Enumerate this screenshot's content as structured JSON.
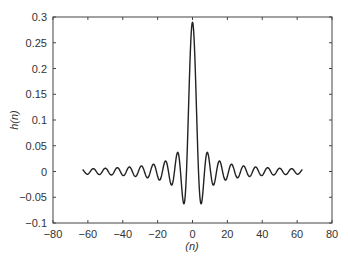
{
  "chart_data": {
    "type": "line",
    "title": "",
    "xlabel": "(n)",
    "ylabel": "h(n)",
    "xlim": [
      -80,
      80
    ],
    "ylim": [
      -0.1,
      0.3
    ],
    "xticks": [
      -80,
      -60,
      -40,
      -20,
      0,
      20,
      40,
      60,
      80
    ],
    "xtick_labels": [
      "−80",
      "−60",
      "−40",
      "−20",
      "0",
      "20",
      "40",
      "60",
      "80"
    ],
    "yticks": [
      -0.1,
      -0.05,
      0,
      0.05,
      0.1,
      0.15,
      0.2,
      0.25,
      0.3
    ],
    "ytick_labels": [
      "−0.1",
      "−0.05",
      "0",
      "0.05",
      "0.1",
      "0.15",
      "0.2",
      "0.25",
      "0.3"
    ],
    "grid": false,
    "legend": null,
    "series": [
      {
        "name": "h(n)",
        "description": "Ideal lowpass impulse response (sinc), h(n) = sin(0.29·π·n)/(π·n), h(0)=0.29",
        "cutoff_over_pi": 0.29,
        "n_range": [
          -63,
          63
        ],
        "x": [
          -60,
          -40,
          -20,
          -10,
          -5,
          -3,
          0,
          3,
          5,
          10,
          20,
          40,
          60
        ],
        "values": [
          0.002,
          -0.004,
          0.012,
          0.01,
          -0.063,
          -0.005,
          0.29,
          -0.005,
          -0.063,
          0.01,
          0.012,
          -0.004,
          0.002
        ],
        "color": "#222222"
      }
    ]
  }
}
